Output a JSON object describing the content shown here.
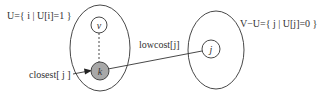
{
  "diagram": {
    "sets": {
      "U": {
        "label": "U={ i | U[i]=1 }"
      },
      "VminusU": {
        "label": "V−U={ j | U[j]=0 }"
      }
    },
    "nodes": {
      "v": "v",
      "k": "k",
      "j": "j"
    },
    "edges": {
      "lowcost": "lowcost[j]",
      "closest": "closest[ j ]"
    },
    "colors": {
      "stroke": "#333333",
      "k_fill": "#a8a8a8",
      "background": "#ffffff"
    }
  }
}
